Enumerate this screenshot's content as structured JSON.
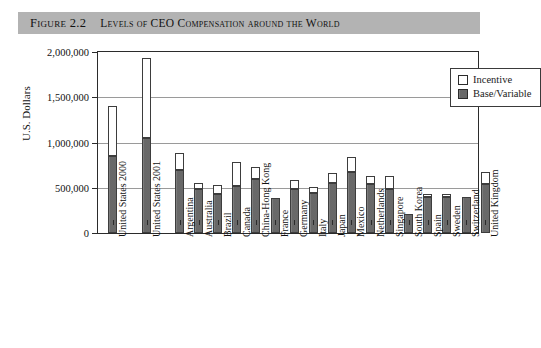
{
  "caption": {
    "figure_label": "Figure 2.2",
    "title": "Levels of CEO Compensation around the World"
  },
  "legend": {
    "position": "top-right",
    "items": [
      {
        "label": "Incentive",
        "color": "#ffffff",
        "swatch": "incentive-swatch"
      },
      {
        "label": "Base/Variable",
        "color": "#6e6e6e",
        "swatch": "base-variable-swatch"
      }
    ]
  },
  "chart_data": {
    "type": "bar",
    "stacked": true,
    "title": "Levels of CEO Compensation around the World",
    "xlabel": "",
    "ylabel": "U.S. Dollars",
    "ylim": [
      0,
      2000000
    ],
    "ytick_values": [
      0,
      500000,
      1000000,
      1500000,
      2000000
    ],
    "ytick_labels": [
      "0",
      "500,000",
      "1,000,000",
      "1,500,000",
      "2,000,000"
    ],
    "grid": true,
    "grid_axis": "y",
    "legend_position": "top-right",
    "categories": [
      "United States 2000",
      "United States 2001",
      "Argentina",
      "Australia",
      "Brazil",
      "Canada",
      "China-Hong Kong",
      "France",
      "Germany",
      "Italy",
      "Japan",
      "Mexico",
      "Netherlands",
      "Singapore",
      "South Korea",
      "Spain",
      "Sweden",
      "Switzerland",
      "United Kingdom"
    ],
    "series": [
      {
        "name": "Base/Variable",
        "color": "#6e6e6e",
        "values": [
          850000,
          1050000,
          700000,
          490000,
          435000,
          515000,
          600000,
          390000,
          490000,
          445000,
          550000,
          670000,
          545000,
          490000,
          215000,
          395000,
          400000,
          400000,
          545000
        ]
      },
      {
        "name": "Incentive",
        "color": "#ffffff",
        "values": [
          550000,
          880000,
          180000,
          65000,
          95000,
          265000,
          130000,
          0,
          100000,
          65000,
          115000,
          170000,
          80000,
          145000,
          0,
          35000,
          30000,
          0,
          125000
        ]
      }
    ],
    "totals": [
      1400000,
      1930000,
      880000,
      555000,
      530000,
      780000,
      730000,
      390000,
      590000,
      510000,
      665000,
      840000,
      625000,
      635000,
      215000,
      430000,
      430000,
      400000,
      670000
    ]
  }
}
